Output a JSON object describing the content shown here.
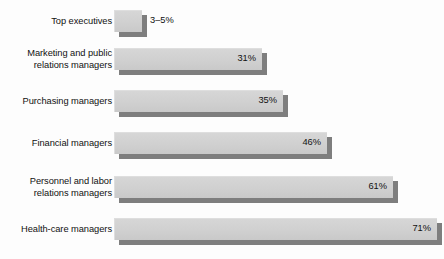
{
  "chart_data": {
    "type": "bar",
    "orientation": "horizontal",
    "title": "",
    "subtitle": "",
    "xlabel": "",
    "ylabel": "",
    "grid": false,
    "legend": null,
    "xlim": [
      0,
      75
    ],
    "axis_visible": false,
    "tick_labels": [],
    "style": "3d-shadowed-horizontal-bars",
    "categories": [
      "Top executives",
      "Marketing and public\nrelations managers",
      "Purchasing managers",
      "Financial managers",
      "Personnel and labor\nrelations managers",
      "Health-care managers"
    ],
    "values": [
      5,
      31,
      35,
      46,
      61,
      71
    ],
    "value_labels": [
      "3–5%",
      "31%",
      "35%",
      "46%",
      "61%",
      "71%"
    ],
    "label_placement": [
      "outside",
      "inside",
      "inside",
      "inside",
      "inside",
      "inside"
    ],
    "bar_px_end": [
      142,
      262,
      283,
      327,
      393,
      437
    ],
    "bar_px_start": 114,
    "row_px_top": [
      10,
      48,
      90,
      132,
      176,
      218
    ],
    "bar_px_height": 22
  },
  "colors": {
    "background": "#fdfdfd",
    "bar_face": "#d2d2d2",
    "bar_shadow": "#7e7e7e",
    "text": "#111111"
  }
}
